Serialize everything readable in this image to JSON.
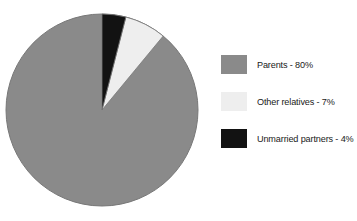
{
  "chart_data": {
    "type": "pie",
    "title": "",
    "subtitle": "",
    "xlabel": "",
    "ylabel": "",
    "grid": false,
    "legend_position": "right",
    "start_angle_deg": 90,
    "direction": "counterclockwise",
    "categories": [
      "Parents",
      "Other relatives",
      "Unmarried partners"
    ],
    "values": [
      80,
      7,
      4
    ],
    "value_unit": "%",
    "colors": [
      "#8a8a8a",
      "#eeeeee",
      "#121212"
    ],
    "labels": [
      "Parents - 80%",
      "Other relatives - 7%",
      "Unmarried partners - 4%"
    ],
    "slices": [
      {
        "name": "Parents",
        "value": 80,
        "label": "Parents - 80%",
        "color": "#8a8a8a"
      },
      {
        "name": "Other relatives",
        "value": 7,
        "label": "Other relatives - 7%",
        "color": "#eeeeee"
      },
      {
        "name": "Unmarried partners",
        "value": 4,
        "label": "Unmarried partners - 4%",
        "color": "#121212"
      }
    ]
  },
  "legend": {
    "items": [
      {
        "label": "Parents - 80%",
        "swatch_color": "#8a8a8a",
        "swatch_name": "legend-swatch-parents"
      },
      {
        "label": "Other relatives - 7%",
        "swatch_color": "#eeeeee",
        "swatch_name": "legend-swatch-other-relatives"
      },
      {
        "label": "Unmarried partners - 4%",
        "swatch_color": "#121212",
        "swatch_name": "legend-swatch-unmarried-partners"
      }
    ]
  },
  "figure": {
    "background": "#ffffff",
    "outline_color": "#787878"
  }
}
